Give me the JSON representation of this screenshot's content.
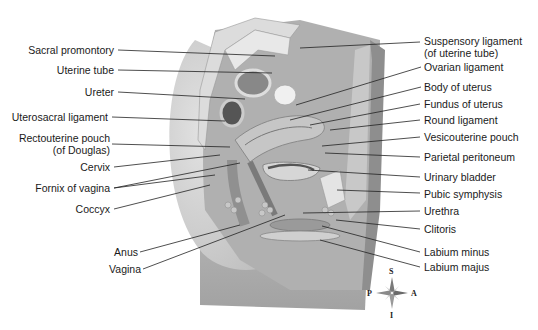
{
  "diagram": {
    "type": "anatomical-illustration",
    "left_labels": [
      {
        "text": "Sacral promontory"
      },
      {
        "text": "Uterine tube"
      },
      {
        "text": "Ureter"
      },
      {
        "text": "Uterosacral ligament"
      },
      {
        "text": "Rectouterine pouch"
      },
      {
        "text": "(of Douglas)"
      },
      {
        "text": "Cervix"
      },
      {
        "text": "Fornix of vagina"
      },
      {
        "text": "Coccyx"
      },
      {
        "text": "Anus"
      },
      {
        "text": "Vagina"
      }
    ],
    "right_labels": [
      {
        "text": "Suspensory ligament"
      },
      {
        "text": "(of uterine tube)"
      },
      {
        "text": "Ovarian ligament"
      },
      {
        "text": "Body of uterus"
      },
      {
        "text": "Fundus of uterus"
      },
      {
        "text": "Round ligament"
      },
      {
        "text": "Vesicouterine pouch"
      },
      {
        "text": "Parietal peritoneum"
      },
      {
        "text": "Urinary bladder"
      },
      {
        "text": "Pubic symphysis"
      },
      {
        "text": "Urethra"
      },
      {
        "text": "Clitoris"
      },
      {
        "text": "Labium minus"
      },
      {
        "text": "Labium majus"
      }
    ],
    "compass": {
      "S": "S",
      "I": "I",
      "P": "P",
      "A": "A"
    }
  }
}
